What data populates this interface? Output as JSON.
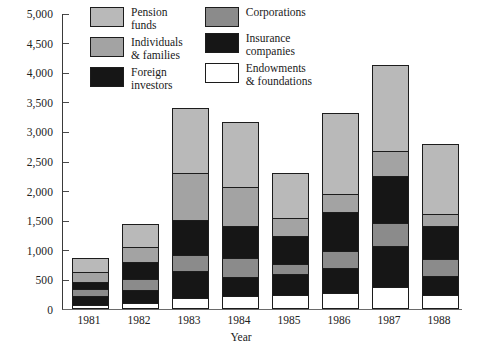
{
  "chart_data": {
    "type": "bar",
    "subtype": "stacked-bar",
    "title": "",
    "xlabel": "Year",
    "ylabel": "",
    "categories": [
      "1981",
      "1982",
      "1983",
      "1984",
      "1985",
      "1986",
      "1987",
      "1988"
    ],
    "ylim": [
      0,
      5000
    ],
    "yticks": [
      0,
      500,
      1000,
      1500,
      2000,
      2500,
      3000,
      3500,
      4000,
      4500,
      5000
    ],
    "ytick_labels": [
      "0",
      "500",
      "1,000",
      "1,500",
      "2,000",
      "2,500",
      "3,000",
      "3,500",
      "4,000",
      "4,500",
      "5,000"
    ],
    "grid": false,
    "legend_position": "top-center",
    "stack_order_bottom_to_top": [
      "Endowments & foundations",
      "Insurance companies",
      "Corporations",
      "Foreign investors",
      "Individuals & families",
      "Pension funds"
    ],
    "series": [
      {
        "name": "Endowments & foundations",
        "color": "#ffffff",
        "values": [
          60,
          90,
          170,
          200,
          230,
          250,
          360,
          230
        ]
      },
      {
        "name": "Insurance companies",
        "color": "#161616",
        "values": [
          150,
          220,
          460,
          330,
          350,
          430,
          700,
          320
        ]
      },
      {
        "name": "Corporations",
        "color": "#8b8b8b",
        "values": [
          130,
          190,
          280,
          330,
          180,
          290,
          390,
          290
        ]
      },
      {
        "name": "Foreign investors",
        "color": "#161616",
        "values": [
          120,
          290,
          590,
          540,
          480,
          660,
          800,
          570
        ]
      },
      {
        "name": "Individuals & families",
        "color": "#a3a3a3",
        "values": [
          170,
          260,
          800,
          660,
          310,
          320,
          430,
          200
        ]
      },
      {
        "name": "Pension funds",
        "color": "#b9b9b9",
        "values": [
          230,
          390,
          1100,
          1100,
          740,
          1360,
          1450,
          1180
        ]
      }
    ],
    "totals": [
      860,
      1440,
      3400,
      3160,
      2290,
      3310,
      4130,
      2790
    ]
  },
  "legend": {
    "columns": [
      {
        "items": [
          {
            "label": "Pension\nfunds",
            "swatch": "sw-pension",
            "swatch_name": "legend-swatch-pension-funds"
          },
          {
            "label": "Individuals\n& families",
            "swatch": "sw-individuals",
            "swatch_name": "legend-swatch-individuals-families"
          },
          {
            "label": "Foreign\ninvestors",
            "swatch": "sw-foreign",
            "swatch_name": "legend-swatch-foreign-investors"
          }
        ]
      },
      {
        "items": [
          {
            "label": "Corporations",
            "swatch": "sw-corporations",
            "swatch_name": "legend-swatch-corporations"
          },
          {
            "label": "Insurance\ncompanies",
            "swatch": "sw-insurance",
            "swatch_name": "legend-swatch-insurance-companies"
          },
          {
            "label": "Endowments\n& foundations",
            "swatch": "sw-endowments",
            "swatch_name": "legend-swatch-endowments-foundations"
          }
        ]
      }
    ]
  }
}
